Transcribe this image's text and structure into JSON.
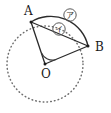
{
  "figure": {
    "background_color": "#ffffff",
    "ink_color": "#2b2b2b",
    "dotted_color": "#6e6e6e",
    "width": 111,
    "height": 113,
    "circle": {
      "center_label": "O",
      "center_x": 45,
      "center_y": 64,
      "radius": 38,
      "stroke_style": "dotted"
    },
    "points": [
      {
        "id": "A",
        "label": "A",
        "x": 31,
        "y": 22,
        "label_x": 24,
        "label_y": 15
      },
      {
        "id": "B",
        "label": "B",
        "x": 88,
        "y": 46,
        "label_x": 95,
        "label_y": 51
      },
      {
        "id": "O",
        "label": "O",
        "x": 45,
        "y": 64,
        "label_x": 41,
        "label_y": 78
      }
    ],
    "segments": [
      {
        "id": "chord-ab",
        "label": "chord AB",
        "from": "A",
        "to": "B",
        "style": "solid"
      },
      {
        "id": "radius-oa",
        "label": "radius OA",
        "from": "O",
        "to": "A",
        "style": "solid"
      },
      {
        "id": "radius-ob",
        "label": "radius OB",
        "from": "O",
        "to": "B",
        "style": "solid"
      }
    ],
    "arcs": [
      {
        "id": "arc-ab",
        "label": "arc AB",
        "from": "A",
        "to": "B",
        "style": "solid"
      }
    ],
    "angle": {
      "id": "angle-aob",
      "label": "angle AOB",
      "vertex": "O",
      "style": "single arc"
    },
    "markers": [
      {
        "id": "marker-arc",
        "label": "ア",
        "refers_to": "arc AB",
        "x": 70,
        "y": 15
      },
      {
        "id": "marker-chord",
        "label": "イ",
        "refers_to": "chord AB",
        "x": 59,
        "y": 29
      }
    ]
  }
}
